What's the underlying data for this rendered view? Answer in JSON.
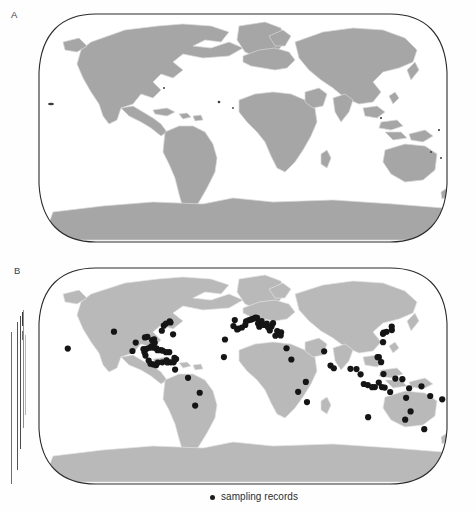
{
  "figure": {
    "type": "two-panel-world-map-figure",
    "background": "#ffffff",
    "panels": [
      {
        "id": "A",
        "label": "A",
        "label_pos": {
          "x": 13,
          "y": 11
        },
        "description": "world distribution map, shaded land",
        "map": {
          "x": 33,
          "y": 12,
          "width": 420,
          "height": 232,
          "land_color": "#a6a6a6",
          "border_color": "#d8d8d8",
          "outline_color": "#2b2b2b",
          "ocean_color": "#ffffff"
        },
        "dots": []
      },
      {
        "id": "B",
        "label": "B",
        "label_pos": {
          "x": 16,
          "y": 268
        },
        "description": "world map with sampling record localities",
        "map": {
          "x": 33,
          "y": 266,
          "width": 420,
          "height": 220,
          "land_color": "#b9b9b9",
          "border_color": "#e4e4e4",
          "outline_color": "#2b2b2b",
          "ocean_color": "#ffffff"
        },
        "dot_color": "#151515",
        "dot_radius": 3.1
      }
    ],
    "legend": {
      "x": 210,
      "y": 492,
      "marker": "filled-circle",
      "marker_color": "#1d1d1d",
      "label": "sampling records"
    },
    "artifacts": {
      "description": "vertical scan streak lines at left margin of panel B",
      "bars": [
        {
          "x": 11,
          "y": 332,
          "w": 1.3,
          "h": 152,
          "color": "#6d6d6d"
        },
        {
          "x": 17,
          "y": 322,
          "w": 1.1,
          "h": 148,
          "color": "#555555"
        },
        {
          "x": 20,
          "y": 316,
          "w": 1.4,
          "h": 133,
          "color": "#4a4a4a"
        },
        {
          "x": 23,
          "y": 310,
          "w": 0.9,
          "h": 118,
          "color": "#8e8e8e"
        },
        {
          "x": 25,
          "y": 335,
          "w": 1.0,
          "h": 80,
          "color": "#b4b4b4"
        },
        {
          "x": 22,
          "y": 312,
          "w": 1.2,
          "h": 14,
          "color": "#3a3a3a"
        },
        {
          "x": 22,
          "y": 331,
          "w": 1.2,
          "h": 9,
          "color": "#6f6f6f"
        }
      ]
    }
  },
  "chart_data": {
    "type": "scatter",
    "title": "",
    "xlabel": "",
    "ylabel": "",
    "projection": "robinson-like",
    "legend_entries": [
      "sampling records"
    ],
    "panel_a_note": "reference distribution map, no point data",
    "sampling_records_note": "black circles mark sampling localities in panel B",
    "sampling_records_count": 96,
    "sampling_records_lonlat": [
      [
        -157.8,
        21.3
      ],
      [
        -120.5,
        34.4
      ],
      [
        -99.2,
        19.4
      ],
      [
        -97.5,
        25.9
      ],
      [
        -90.1,
        29.9
      ],
      [
        -88.0,
        30.4
      ],
      [
        -83.0,
        27.8
      ],
      [
        -81.4,
        28.5
      ],
      [
        -80.2,
        25.8
      ],
      [
        -76.0,
        35.1
      ],
      [
        -75.5,
        39.0
      ],
      [
        -74.0,
        40.7
      ],
      [
        -71.1,
        42.4
      ],
      [
        -70.0,
        41.5
      ],
      [
        -64.8,
        32.3
      ],
      [
        -66.1,
        18.5
      ],
      [
        -68.0,
        12.2
      ],
      [
        -61.0,
        14.0
      ],
      [
        -59.5,
        13.1
      ],
      [
        -69.0,
        18.5
      ],
      [
        -72.3,
        19.7
      ],
      [
        -74.0,
        20.0
      ],
      [
        -76.8,
        20.0
      ],
      [
        -78.0,
        21.5
      ],
      [
        -80.5,
        22.0
      ],
      [
        -82.4,
        23.1
      ],
      [
        -84.0,
        22.0
      ],
      [
        -86.8,
        21.1
      ],
      [
        -88.3,
        18.5
      ],
      [
        -89.6,
        20.9
      ],
      [
        -87.0,
        15.8
      ],
      [
        -83.8,
        12.0
      ],
      [
        -82.0,
        9.5
      ],
      [
        -79.5,
        9.0
      ],
      [
        -77.0,
        8.4
      ],
      [
        -75.5,
        10.4
      ],
      [
        -71.6,
        10.6
      ],
      [
        -67.0,
        10.5
      ],
      [
        -64.0,
        10.6
      ],
      [
        -61.5,
        10.6
      ],
      [
        -60.0,
        5.0
      ],
      [
        -48.5,
        -1.4
      ],
      [
        -43.2,
        -22.9
      ],
      [
        -38.5,
        -13.0
      ],
      [
        -17.0,
        14.7
      ],
      [
        -16.5,
        28.3
      ],
      [
        -9.1,
        38.7
      ],
      [
        -8.0,
        43.4
      ],
      [
        -5.5,
        36.1
      ],
      [
        -4.4,
        36.7
      ],
      [
        -1.0,
        37.6
      ],
      [
        2.2,
        39.6
      ],
      [
        3.0,
        42.5
      ],
      [
        5.4,
        43.3
      ],
      [
        7.7,
        43.7
      ],
      [
        9.5,
        44.3
      ],
      [
        12.3,
        45.4
      ],
      [
        13.8,
        45.1
      ],
      [
        14.5,
        40.8
      ],
      [
        15.5,
        38.2
      ],
      [
        16.9,
        41.1
      ],
      [
        18.1,
        42.6
      ],
      [
        20.0,
        39.6
      ],
      [
        22.9,
        40.6
      ],
      [
        23.7,
        37.9
      ],
      [
        25.1,
        35.3
      ],
      [
        27.1,
        38.4
      ],
      [
        28.9,
        41.0
      ],
      [
        29.9,
        31.2
      ],
      [
        32.0,
        34.9
      ],
      [
        34.8,
        31.5
      ],
      [
        35.5,
        33.9
      ],
      [
        39.2,
        21.5
      ],
      [
        43.0,
        12.8
      ],
      [
        49.0,
        -12.3
      ],
      [
        55.5,
        -4.6
      ],
      [
        57.5,
        -20.2
      ],
      [
        72.8,
        19.1
      ],
      [
        77.5,
        8.1
      ],
      [
        80.3,
        6.0
      ],
      [
        95.0,
        5.6
      ],
      [
        100.3,
        5.4
      ],
      [
        103.8,
        1.3
      ],
      [
        106.8,
        -6.2
      ],
      [
        110.4,
        -7.0
      ],
      [
        114.4,
        -8.7
      ],
      [
        116.8,
        -8.6
      ],
      [
        120.0,
        -5.1
      ],
      [
        123.0,
        -8.6
      ],
      [
        125.5,
        -9.0
      ],
      [
        119.9,
        14.6
      ],
      [
        121.0,
        14.6
      ],
      [
        122.5,
        10.7
      ],
      [
        124.0,
        1.5
      ],
      [
        127.4,
        26.2
      ],
      [
        129.9,
        32.7
      ],
      [
        131.0,
        33.6
      ],
      [
        134.0,
        34.3
      ],
      [
        139.7,
        35.6
      ],
      [
        141.3,
        38.3
      ],
      [
        134.5,
        -2.0
      ],
      [
        140.7,
        -2.5
      ],
      [
        147.2,
        -9.5
      ],
      [
        151.2,
        -33.9
      ],
      [
        153.0,
        -27.5
      ],
      [
        145.8,
        -16.9
      ],
      [
        130.8,
        -12.4
      ],
      [
        115.8,
        -31.9
      ],
      [
        158.0,
        -8.0
      ],
      [
        167.0,
        -15.5
      ],
      [
        174.8,
        -41.3
      ],
      [
        178.4,
        -18.1
      ]
    ]
  }
}
